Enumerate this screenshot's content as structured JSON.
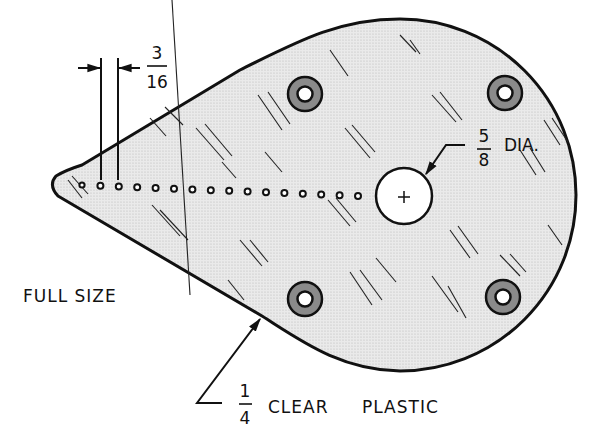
{
  "drawing": {
    "title_label": "FULL SIZE",
    "part": "teardrop template plate",
    "material": {
      "thickness_numerator": "1",
      "thickness_denominator": "4",
      "text": "CLEAR",
      "text2": "PLASTIC"
    },
    "hole_spacing": {
      "numerator": "3",
      "denominator": "16"
    },
    "center_hole": {
      "numerator": "5",
      "denominator": "8",
      "suffix": "DIA."
    },
    "small_hole_count": 16,
    "mounting_hole_count": 4,
    "colors": {
      "ink": "#111111",
      "plate_fill": "#e6e6e6",
      "grommet": "#8a8a8a",
      "paper": "#ffffff"
    }
  }
}
